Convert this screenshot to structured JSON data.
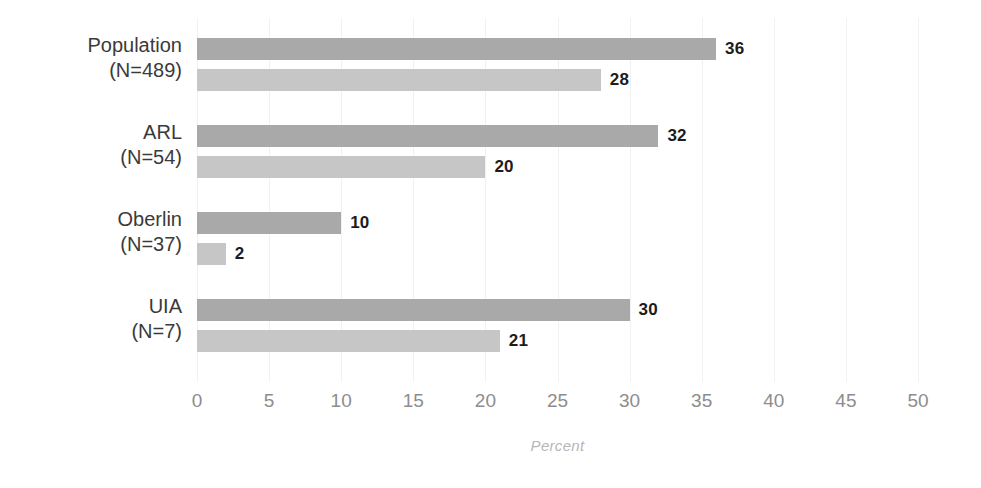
{
  "chart_data": {
    "type": "bar",
    "orientation": "horizontal",
    "title": "",
    "xlabel": "Percent",
    "ylabel": "",
    "xlim": [
      0,
      50
    ],
    "xticks": [
      0,
      5,
      10,
      15,
      20,
      25,
      30,
      35,
      40,
      45,
      50
    ],
    "xtick_labels": [
      "0",
      "5",
      "10",
      "15",
      "20",
      "25",
      "30",
      "35",
      "40",
      "45",
      "50"
    ],
    "grid": true,
    "grid_axis": "x",
    "legend": "none",
    "categories": [
      "Population",
      "ARL",
      "Oberlin",
      "UIA"
    ],
    "category_counts": [
      "(N=489)",
      "(N=54)",
      "(N=37)",
      "(N=7)"
    ],
    "category_labels": [
      {
        "name": "Population",
        "count": "(N=489)"
      },
      {
        "name": "ARL",
        "count": "(N=54)"
      },
      {
        "name": "Oberlin",
        "count": "(N=37)"
      },
      {
        "name": "UIA",
        "count": "(N=7)"
      }
    ],
    "series": [
      {
        "name": "series-1",
        "color": "#a9a9a9",
        "values": [
          36,
          32,
          10,
          30
        ],
        "value_labels": [
          "36",
          "32",
          "10",
          "30"
        ]
      },
      {
        "name": "series-2",
        "color": "#c6c6c6",
        "values": [
          28,
          20,
          2,
          21
        ],
        "value_labels": [
          "28",
          "20",
          "2",
          "21"
        ]
      }
    ],
    "colors": {
      "series_1": "#a9a9a9",
      "series_2": "#c6c6c6",
      "grid": "#f1f1f1",
      "tick_text": "#8d8d8d",
      "value_text": "#1c1c1c",
      "category_text": "#3a3a3a",
      "axis_title_text": "#b6b6b6",
      "background": "#ffffff"
    }
  }
}
